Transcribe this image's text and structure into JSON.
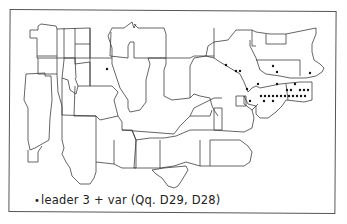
{
  "map": {
    "subject": "Eastern United States dialect map",
    "legend": {
      "symbol": "•",
      "text": "leader 3 + var  (Qq. D29, D28)"
    },
    "colors": {
      "background": "#ffffff",
      "lines": "#333333",
      "dots": "#111111"
    },
    "dots": [
      [
        107,
        69
      ],
      [
        226,
        65
      ],
      [
        236,
        71
      ],
      [
        240,
        71
      ],
      [
        273,
        66
      ],
      [
        277,
        72
      ],
      [
        310,
        73
      ],
      [
        258,
        84
      ],
      [
        277,
        84
      ],
      [
        295,
        84
      ],
      [
        247,
        89
      ],
      [
        287,
        90
      ],
      [
        291,
        90
      ],
      [
        300,
        90
      ],
      [
        304,
        90
      ],
      [
        308,
        90
      ],
      [
        261,
        96
      ],
      [
        265,
        96
      ],
      [
        269,
        96
      ],
      [
        273,
        96
      ],
      [
        277,
        96
      ],
      [
        281,
        96
      ],
      [
        285,
        96
      ],
      [
        289,
        96
      ],
      [
        293,
        96
      ],
      [
        297,
        96
      ],
      [
        301,
        96
      ],
      [
        305,
        96
      ],
      [
        250,
        101
      ],
      [
        264,
        101
      ],
      [
        273,
        101
      ]
    ]
  }
}
